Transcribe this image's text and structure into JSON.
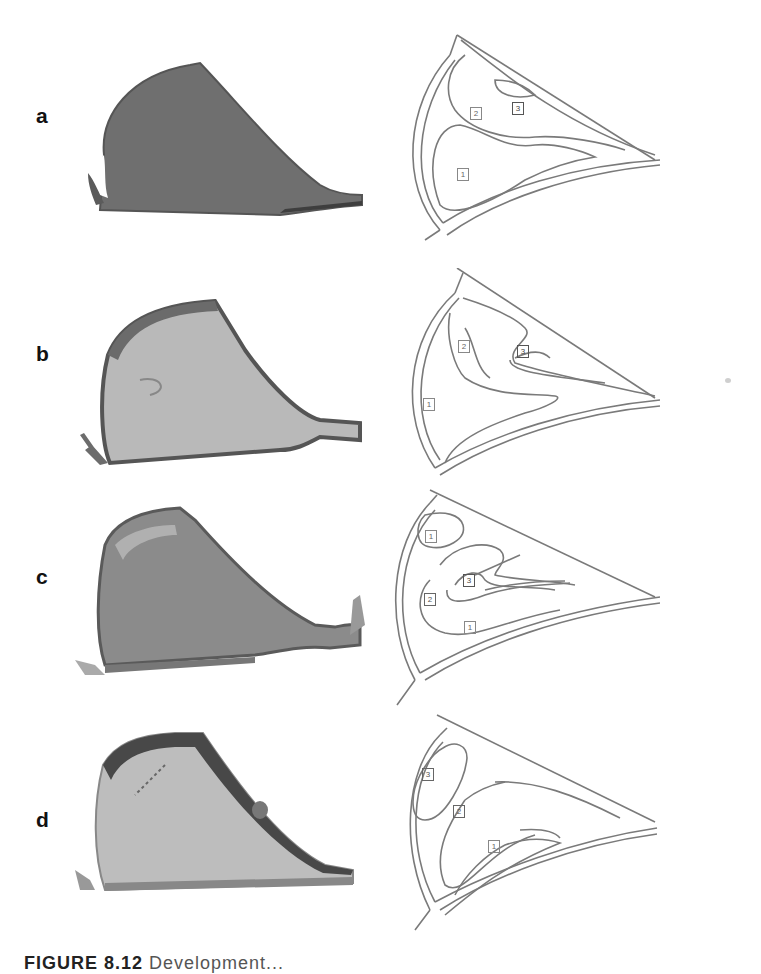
{
  "figure": {
    "panels": [
      {
        "label": "a",
        "diagram_regions": [
          {
            "id": "1",
            "text": "1"
          },
          {
            "id": "2",
            "text": "2"
          },
          {
            "id": "3",
            "text": "3"
          }
        ]
      },
      {
        "label": "b",
        "diagram_regions": [
          {
            "id": "1",
            "text": "1"
          },
          {
            "id": "2",
            "text": "2"
          },
          {
            "id": "3",
            "text": "3"
          }
        ]
      },
      {
        "label": "c",
        "diagram_regions": [
          {
            "id": "1-upper",
            "text": "1"
          },
          {
            "id": "2",
            "text": "2"
          },
          {
            "id": "3",
            "text": "3"
          },
          {
            "id": "1-lower",
            "text": "1"
          }
        ]
      },
      {
        "label": "d",
        "diagram_regions": [
          {
            "id": "3",
            "text": "3"
          },
          {
            "id": "2",
            "text": "2"
          },
          {
            "id": "1",
            "text": "1"
          }
        ]
      }
    ],
    "caption": {
      "prefix": "FIGURE 8.12",
      "rest": "  Development..."
    }
  },
  "colors": {
    "photo_a_fill": "#6e6e6e",
    "photo_b_fill": "#b8b8b8",
    "photo_c_fill": "#8a8a8a",
    "photo_d_fill": "#bdbdbd",
    "outline_dark": "#4a4a4a",
    "line": "#7a7a7a"
  }
}
